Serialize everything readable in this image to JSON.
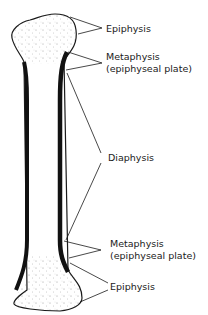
{
  "diagram": {
    "labels": {
      "epiphysis_top": "Epiphysis",
      "metaphysis_top": "Metaphysis",
      "metaphysis_top_sub": "(epiphyseal plate)",
      "diaphysis": "Diaphysis",
      "metaphysis_bottom": "Metaphysis",
      "metaphysis_bottom_sub": "(epiphyseal plate)",
      "epiphysis_bottom": "Epiphysis"
    },
    "colors": {
      "ink": "#1a1a1a",
      "background": "#ffffff"
    }
  }
}
